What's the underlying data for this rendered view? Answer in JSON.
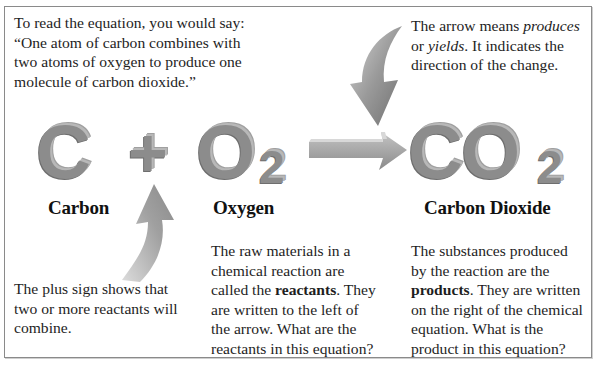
{
  "callouts": {
    "equation_reading": {
      "line1": "To read the equation, you would say:",
      "line2": "“One atom of carbon combines with",
      "line3": "two atoms of oxygen to produce one",
      "line4": "molecule of carbon dioxide.”"
    },
    "arrow_meaning": {
      "line1_prefix": "The arrow means ",
      "line1_em": "produces",
      "line2_prefix": "or ",
      "line2_em": "yields",
      "line2_suffix": ". It indicates the",
      "line3": "direction of the change."
    },
    "plus_sign": {
      "line1": "The plus sign shows that",
      "line2": "two or more reactants will",
      "line3": "combine."
    },
    "reactants": {
      "line1": "The raw materials in a",
      "line2": "chemical reaction are",
      "line3_prefix": "called the ",
      "line3_bold": "reactants",
      "line3_suffix": ". They",
      "line4": "are written to the left of",
      "line5": "the arrow. What are the",
      "line6": "reactants in this equation?"
    },
    "products": {
      "line1": "The substances produced",
      "line2": "by the reaction are the",
      "line3_bold": "products",
      "line3_suffix": ". They are written",
      "line4": "on the right of the chemical",
      "line5": "equation. What is the",
      "line6": "product in this equation?"
    }
  },
  "equation": {
    "reactant1": {
      "symbol": "C",
      "label": "Carbon"
    },
    "operator": "+",
    "reactant2": {
      "symbol": "O",
      "subscript": "2",
      "label": "Oxygen"
    },
    "product": {
      "symbol": "CO",
      "subscript": "2",
      "label": "Carbon Dioxide"
    }
  },
  "colors": {
    "glyph_gray": "#8c8c8c",
    "arrow_gray": "#9a9a9a",
    "text": "#1e1e1e",
    "border": "#8a8a8a"
  }
}
